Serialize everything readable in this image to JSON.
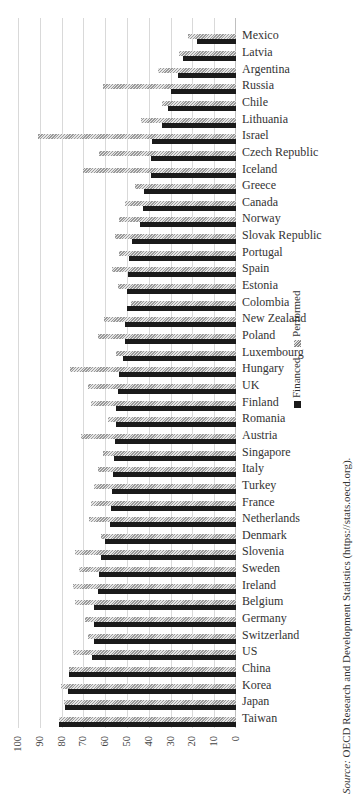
{
  "chart_data": {
    "type": "bar",
    "orientation": "rotated (vertical bars rotated 90 degrees counterclockwise)",
    "title": "",
    "xlabel": "",
    "ylabel": "",
    "ylim": [
      0,
      100
    ],
    "yticks": [
      0,
      10,
      20,
      30,
      40,
      50,
      60,
      70,
      80,
      90,
      100
    ],
    "grid": true,
    "legend_position": "right (rotated, below plot)",
    "categories": [
      "Taiwan",
      "Japan",
      "Korea",
      "China",
      "US",
      "Switzerland",
      "Germany",
      "Belgium",
      "Ireland",
      "Sweden",
      "Slovenia",
      "Denmark",
      "Netherlands",
      "France",
      "Turkey",
      "Italy",
      "Singapore",
      "Austria",
      "Romania",
      "Finland",
      "UK",
      "Hungary",
      "Luxembourg",
      "Poland",
      "New Zealand",
      "Colombia",
      "Estonia",
      "Spain",
      "Portugal",
      "Slovak Republic",
      "Norway",
      "Canada",
      "Greece",
      "Iceland",
      "Czech Republic",
      "Israel",
      "Lithuania",
      "Chile",
      "Russia",
      "Argentina",
      "Latvia",
      "Mexico"
    ],
    "series": [
      {
        "name": "Financed",
        "style": "solid black",
        "values": [
          81,
          78.5,
          77,
          76.5,
          66,
          65,
          65,
          65,
          63.5,
          63,
          62,
          60,
          58,
          57.5,
          57,
          56.5,
          56,
          55.5,
          55,
          55,
          54,
          53.5,
          52,
          51,
          51,
          50,
          50,
          49.5,
          49,
          47.5,
          44,
          42.5,
          42,
          39,
          39,
          38.5,
          34,
          31,
          30,
          26.5,
          24.5,
          18
        ]
      },
      {
        "name": "Performed",
        "style": "gray hatched",
        "values": [
          81,
          79,
          80.5,
          76.5,
          75,
          68,
          69.5,
          74,
          75,
          72,
          74,
          62,
          67.5,
          66.5,
          65,
          63.5,
          61,
          71,
          58.5,
          66.5,
          68,
          76,
          55,
          63.5,
          60.5,
          48,
          54,
          57,
          53.5,
          55.5,
          53.5,
          51,
          46.5,
          70,
          63,
          91,
          43.5,
          34,
          61,
          36,
          26,
          22
        ]
      }
    ],
    "source": "OECD Research and Development Statistics (https://stats.oecd.org)."
  },
  "legend": {
    "financed": "Financed",
    "performed": "Performed"
  },
  "source": {
    "prefix": "Source:",
    "text": " OECD Research and Development Statistics (https://stats.oecd.org)."
  }
}
